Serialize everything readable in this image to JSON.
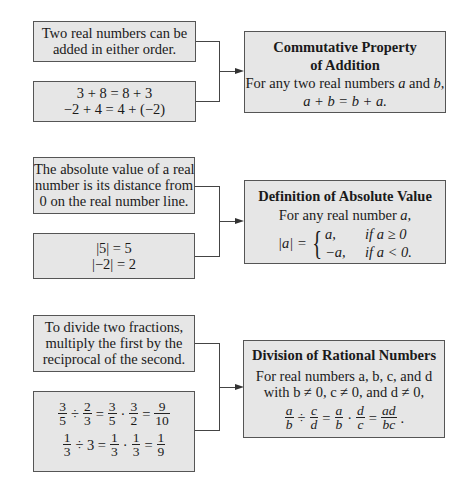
{
  "sections": [
    {
      "top_text": [
        "Two real numbers can be",
        "added in either order."
      ],
      "examples": [
        "3 + 8 = 8 + 3",
        "−2 + 4 = 4 + (−2)"
      ],
      "rule_title": [
        "Commutative Property",
        "of Addition"
      ],
      "rule_lines": [
        "For any two real numbers",
        "a",
        "and",
        "b,"
      ],
      "rule_formula": "a + b = b + a."
    },
    {
      "top_text": [
        "The absolute value of a real",
        "number is its distance from",
        "0 on the real number line."
      ],
      "examples": [
        "|5| = 5",
        "|−2| = 2"
      ],
      "rule_title": [
        "Definition of Absolute Value"
      ],
      "rule_lines": [
        "For any real number",
        "a,"
      ],
      "rule_formula": {
        "lhs": "|a| =",
        "cases": [
          {
            "value": "a,",
            "condition": "if a ≥ 0"
          },
          {
            "value": "−a,",
            "condition": "if a < 0."
          }
        ]
      }
    },
    {
      "top_text": [
        "To divide two fractions,",
        "multiply the first by the",
        "reciprocal of the second."
      ],
      "examples": [
        {
          "terms": [
            [
              "3",
              "5"
            ],
            "÷",
            [
              "2",
              "3"
            ],
            "=",
            [
              "3",
              "5"
            ],
            "·",
            [
              "3",
              "2"
            ],
            "=",
            [
              "9",
              "10"
            ]
          ]
        },
        {
          "terms": [
            [
              "1",
              "3"
            ],
            "÷ 3 =",
            [
              "1",
              "3"
            ],
            "·",
            [
              "1",
              "3"
            ],
            "=",
            [
              "1",
              "9"
            ]
          ]
        }
      ],
      "rule_title": [
        "Division of Rational Numbers"
      ],
      "rule_lines": [
        "For real numbers a, b, c, and d",
        "with b ≠ 0, c ≠ 0, and d ≠ 0,"
      ],
      "rule_formula": {
        "terms": [
          [
            "a",
            "b"
          ],
          "÷",
          [
            "c",
            "d"
          ],
          "=",
          [
            "a",
            "b"
          ],
          "·",
          [
            "d",
            "c"
          ],
          "=",
          [
            "ad",
            "bc"
          ],
          "."
        ]
      }
    }
  ],
  "colors": {
    "box_fill": "#e6e6e6",
    "border": "#555555",
    "connector": "#444444"
  }
}
